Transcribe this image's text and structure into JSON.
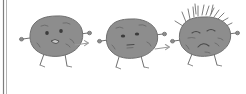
{
  "figure": {
    "background_color": "#ffffff",
    "body_color": "#8d8d8d",
    "outline_color": "#6f6f6f",
    "face_color": "#3c3c3c",
    "arrow_color": "#9a9a9a",
    "rule_color": "#7d7d7d",
    "stage_count": "3",
    "arrow_count": "2"
  },
  "left_rule": {
    "label": "vertical margin rule",
    "x": "4",
    "top": "0",
    "bottom": "94"
  },
  "stages": [
    {
      "index": "1",
      "name": "healthy-blob",
      "expression": "open smiling mouth with round wide eyes",
      "eyes": "two round dark eyes",
      "mouth": "small open rounded mouth",
      "arms": "2",
      "legs": "2",
      "spikes": "0",
      "center_x": "56",
      "center_y": "36"
    },
    {
      "index": "2",
      "name": "neutral-blob",
      "expression": "flat narrowed eyes with small straight mouth",
      "eyes": "two narrow oval eyes",
      "mouth": "small flat mouth",
      "arms": "2",
      "legs": "2",
      "spikes": "0",
      "center_x": "131",
      "center_y": "38"
    },
    {
      "index": "3",
      "name": "sick-spiky-blob",
      "expression": "squinting closed eyes with downturned frowning mouth",
      "eyes": "two closed squinting eyes",
      "mouth": "downturned frown",
      "arms": "2",
      "legs": "2",
      "spikes": "14",
      "center_x": "204",
      "center_y": "36"
    }
  ],
  "arrows": [
    {
      "index": "1",
      "name": "arrow-stage-1-to-2",
      "from_stage": "1",
      "to_stage": "2",
      "x": "82",
      "y": "44"
    },
    {
      "index": "2",
      "name": "arrow-stage-2-to-3",
      "from_stage": "2",
      "to_stage": "3",
      "x": "162",
      "y": "47"
    }
  ]
}
